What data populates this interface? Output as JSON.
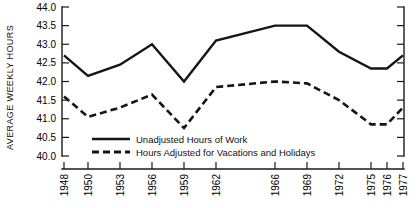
{
  "chart_data": {
    "type": "line",
    "title": "",
    "xlabel": "",
    "ylabel": "AVERAGE WEEKLY HOURS",
    "ylim": [
      40.0,
      44.0
    ],
    "ytick_labels": [
      "44.0",
      "43.5",
      "43.0",
      "42.5",
      "42.0",
      "41.5",
      "41.0",
      "40.5",
      "40.0"
    ],
    "ytick_values": [
      44.0,
      43.5,
      43.0,
      42.5,
      42.0,
      41.5,
      41.0,
      40.5,
      40.0
    ],
    "categories": [
      "1948",
      "1950",
      "1953",
      "1956",
      "1959",
      "1962",
      "1966",
      "1969",
      "1972",
      "1975",
      "1976",
      "1977"
    ],
    "x": [
      1948,
      1950,
      1953,
      1956,
      1959,
      1962,
      1966,
      1969,
      1972,
      1975,
      1976,
      1977
    ],
    "grid": false,
    "legend_position": "inside-bottom-left",
    "series": [
      {
        "name": "Unadjusted Hours of Work",
        "style": "solid",
        "color": "#151515",
        "values": [
          42.7,
          42.15,
          42.45,
          43.0,
          42.0,
          43.1,
          43.5,
          43.5,
          42.8,
          42.35,
          42.35,
          42.7
        ]
      },
      {
        "name": "Hours Adjusted for Vacations and Holidays",
        "style": "dashed",
        "color": "#151515",
        "values": [
          41.6,
          41.05,
          41.3,
          41.65,
          40.75,
          41.85,
          42.0,
          41.95,
          41.5,
          40.85,
          40.85,
          41.3
        ]
      }
    ]
  },
  "legend": {
    "entries": [
      {
        "label": "Unadjusted Hours of Work",
        "style": "solid"
      },
      {
        "label": "Hours Adjusted for Vacations and Holidays",
        "style": "dashed"
      }
    ]
  },
  "axes": {
    "y_title": "AVERAGE WEEKLY HOURS"
  }
}
